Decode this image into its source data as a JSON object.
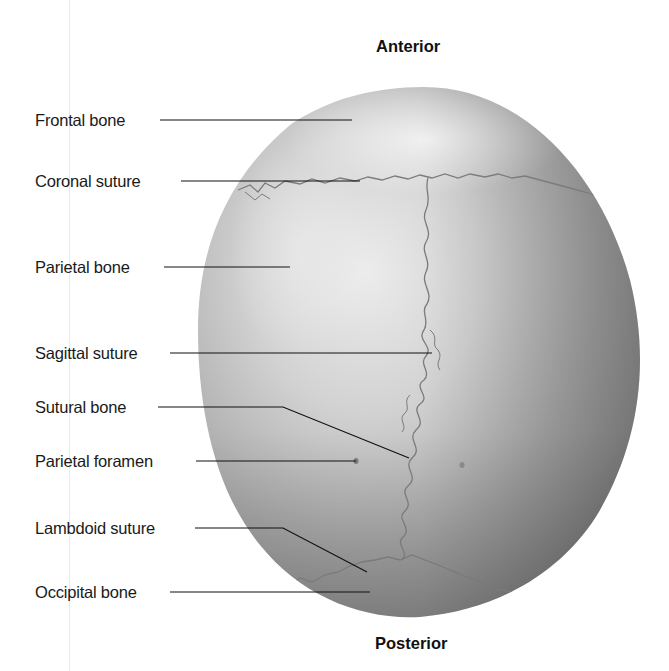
{
  "figure": {
    "orientation": {
      "top": "Anterior",
      "bottom": "Posterior"
    },
    "labels": [
      {
        "id": "frontal-bone",
        "text": "Frontal bone",
        "x": 35,
        "y": 120
      },
      {
        "id": "coronal-suture",
        "text": "Coronal suture",
        "x": 35,
        "y": 181
      },
      {
        "id": "parietal-bone",
        "text": "Parietal bone",
        "x": 35,
        "y": 267
      },
      {
        "id": "sagittal-suture",
        "text": "Sagittal suture",
        "x": 35,
        "y": 353
      },
      {
        "id": "sutural-bone",
        "text": "Sutural bone",
        "x": 35,
        "y": 407
      },
      {
        "id": "parietal-foramen",
        "text": "Parietal foramen",
        "x": 35,
        "y": 461
      },
      {
        "id": "lambdoid-suture",
        "text": "Lambdoid suture",
        "x": 35,
        "y": 528
      },
      {
        "id": "occipital-bone",
        "text": "Occipital bone",
        "x": 35,
        "y": 592
      }
    ],
    "colors": {
      "bone_light": "#e8e8e8",
      "bone_mid": "#b8b8b8",
      "bone_dark": "#8c8c8c",
      "suture": "#7a7a7a",
      "leader": "#111111",
      "text": "#1a1a1a"
    }
  }
}
